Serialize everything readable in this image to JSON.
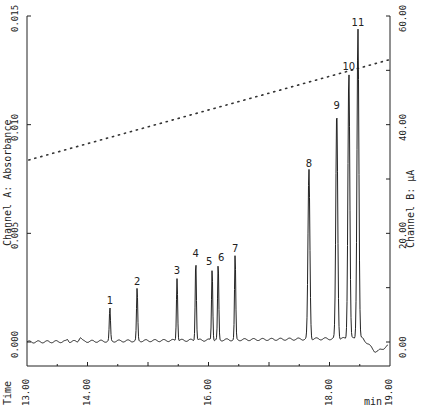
{
  "chart_data": {
    "type": "line",
    "title": "",
    "xlabel": "Time min",
    "ylabel": "Channel A: Absorbance",
    "y2label": "Channel B: µA",
    "xlim": [
      13.0,
      19.0
    ],
    "ylim": [
      0.0,
      0.015
    ],
    "y2lim": [
      0.0,
      60.0
    ],
    "x_ticks": [
      "13.00",
      "14.00",
      "16.00",
      "18.00",
      "19.00"
    ],
    "y_ticks": [
      "0.000",
      "0.005",
      "0.010",
      "0.015"
    ],
    "y2_ticks": [
      "0.00",
      "20.00",
      "40.00",
      "60.00"
    ],
    "grid": false,
    "series": [
      {
        "name": "Channel A: Absorbance (chromatogram)",
        "style": "solid",
        "baseline": 0.0,
        "peaks": [
          {
            "label": "1",
            "time": 14.37,
            "height": 0.0015
          },
          {
            "label": "2",
            "time": 14.82,
            "height": 0.0024
          },
          {
            "label": "3",
            "time": 15.48,
            "height": 0.0029
          },
          {
            "label": "4",
            "time": 15.79,
            "height": 0.0037
          },
          {
            "label": "5",
            "time": 16.06,
            "height": 0.0033
          },
          {
            "label": "6",
            "time": 16.16,
            "height": 0.0035
          },
          {
            "label": "7",
            "time": 16.44,
            "height": 0.0039
          },
          {
            "label": "8",
            "time": 17.66,
            "height": 0.0078
          },
          {
            "label": "9",
            "time": 18.12,
            "height": 0.0105
          },
          {
            "label": "10",
            "time": 18.32,
            "height": 0.0123
          },
          {
            "label": "11",
            "time": 18.47,
            "height": 0.0143
          }
        ]
      },
      {
        "name": "Channel B: µA (gradient)",
        "style": "dotted",
        "x": [
          13.03,
          19.0
        ],
        "y": [
          33.5,
          52.0
        ]
      }
    ]
  },
  "axes": {
    "left_label": "Channel A: Absorbance",
    "right_label": "Channel B: µA",
    "bottom_left_label": "Time",
    "bottom_right_label": "min"
  }
}
